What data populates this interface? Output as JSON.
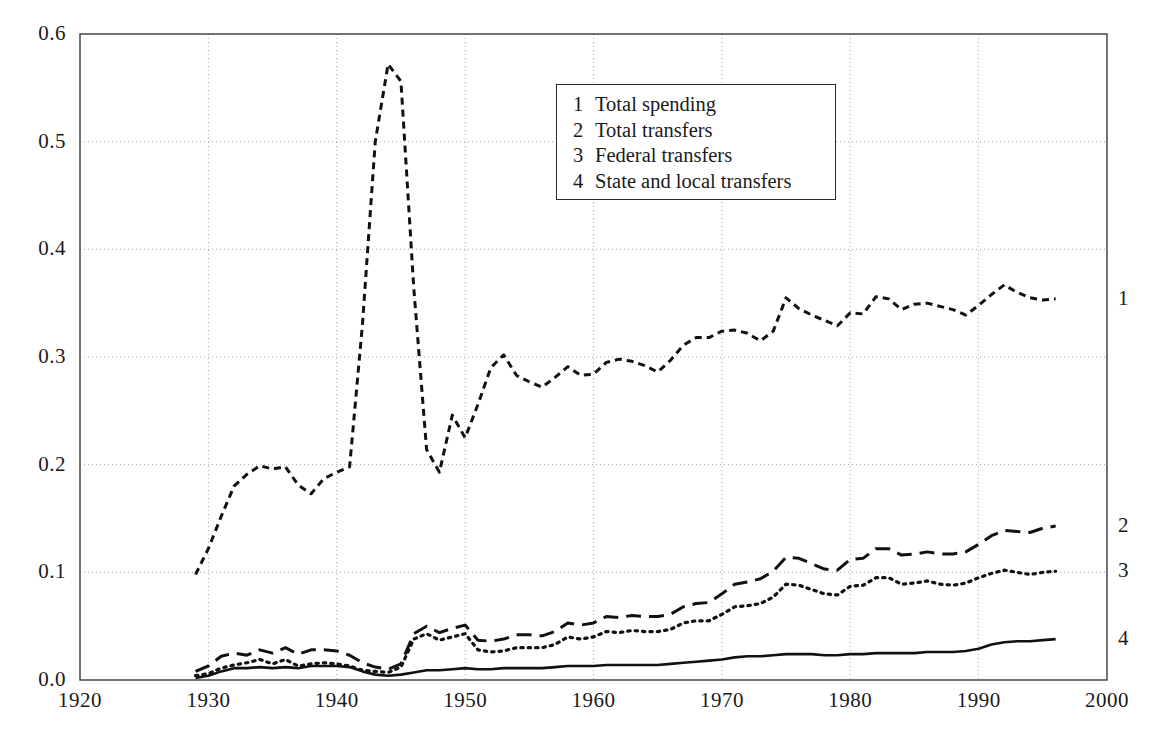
{
  "chart_data": {
    "type": "line",
    "title": "",
    "xlabel": "",
    "ylabel": "",
    "xlim": [
      1920,
      2000
    ],
    "ylim": [
      0.0,
      0.6
    ],
    "grid": true,
    "xticks": [
      "1920",
      "1930",
      "1940",
      "1950",
      "1960",
      "1970",
      "1980",
      "1990",
      "2000"
    ],
    "yticks": [
      "0.0",
      "0.1",
      "0.2",
      "0.3",
      "0.4",
      "0.5",
      "0.6"
    ],
    "legend_position": "upper-center",
    "legend": [
      {
        "key": "1",
        "label": "Total spending"
      },
      {
        "key": "2",
        "label": "Total transfers"
      },
      {
        "key": "3",
        "label": "Federal transfers"
      },
      {
        "key": "4",
        "label": "State and local transfers"
      }
    ],
    "x": [
      1929,
      1930,
      1931,
      1932,
      1933,
      1934,
      1935,
      1936,
      1937,
      1938,
      1939,
      1940,
      1941,
      1942,
      1943,
      1944,
      1945,
      1946,
      1947,
      1948,
      1949,
      1950,
      1951,
      1952,
      1953,
      1954,
      1955,
      1956,
      1957,
      1958,
      1959,
      1960,
      1961,
      1962,
      1963,
      1964,
      1965,
      1966,
      1967,
      1968,
      1969,
      1970,
      1971,
      1972,
      1973,
      1974,
      1975,
      1976,
      1977,
      1978,
      1979,
      1980,
      1981,
      1982,
      1983,
      1984,
      1985,
      1986,
      1987,
      1988,
      1989,
      1990,
      1991,
      1992,
      1993,
      1994,
      1995,
      1996
    ],
    "series": [
      {
        "name": "Total spending",
        "key": "1",
        "style": "short-dash",
        "end_label": "1",
        "values": [
          0.098,
          0.122,
          0.152,
          0.18,
          0.191,
          0.199,
          0.196,
          0.198,
          0.181,
          0.173,
          0.187,
          0.193,
          0.198,
          0.33,
          0.5,
          0.572,
          0.556,
          0.364,
          0.214,
          0.193,
          0.246,
          0.225,
          0.256,
          0.29,
          0.302,
          0.283,
          0.277,
          0.272,
          0.281,
          0.291,
          0.283,
          0.284,
          0.295,
          0.298,
          0.296,
          0.292,
          0.286,
          0.297,
          0.311,
          0.318,
          0.318,
          0.324,
          0.325,
          0.322,
          0.315,
          0.324,
          0.355,
          0.345,
          0.339,
          0.334,
          0.329,
          0.341,
          0.34,
          0.356,
          0.354,
          0.344,
          0.349,
          0.35,
          0.347,
          0.344,
          0.339,
          0.348,
          0.358,
          0.367,
          0.36,
          0.355,
          0.353,
          0.354
        ]
      },
      {
        "name": "Total transfers",
        "key": "2",
        "style": "long-dash",
        "end_label": "2",
        "values": [
          0.008,
          0.013,
          0.022,
          0.025,
          0.023,
          0.028,
          0.025,
          0.03,
          0.024,
          0.028,
          0.028,
          0.027,
          0.023,
          0.016,
          0.012,
          0.01,
          0.015,
          0.043,
          0.05,
          0.044,
          0.048,
          0.051,
          0.037,
          0.036,
          0.038,
          0.042,
          0.042,
          0.041,
          0.045,
          0.053,
          0.051,
          0.053,
          0.059,
          0.058,
          0.06,
          0.059,
          0.059,
          0.061,
          0.068,
          0.071,
          0.072,
          0.08,
          0.089,
          0.091,
          0.094,
          0.101,
          0.114,
          0.113,
          0.108,
          0.103,
          0.102,
          0.112,
          0.113,
          0.122,
          0.122,
          0.116,
          0.117,
          0.119,
          0.117,
          0.117,
          0.119,
          0.126,
          0.134,
          0.139,
          0.138,
          0.137,
          0.141,
          0.143
        ]
      },
      {
        "name": "Federal transfers",
        "key": "3",
        "style": "dotted",
        "end_label": "3",
        "values": [
          0.004,
          0.006,
          0.011,
          0.014,
          0.016,
          0.019,
          0.015,
          0.019,
          0.013,
          0.015,
          0.016,
          0.015,
          0.013,
          0.009,
          0.008,
          0.007,
          0.012,
          0.038,
          0.043,
          0.037,
          0.04,
          0.043,
          0.028,
          0.026,
          0.027,
          0.03,
          0.03,
          0.03,
          0.033,
          0.04,
          0.038,
          0.04,
          0.045,
          0.044,
          0.046,
          0.045,
          0.045,
          0.047,
          0.053,
          0.055,
          0.055,
          0.061,
          0.068,
          0.069,
          0.071,
          0.077,
          0.089,
          0.088,
          0.084,
          0.08,
          0.079,
          0.087,
          0.088,
          0.095,
          0.095,
          0.089,
          0.09,
          0.092,
          0.089,
          0.088,
          0.09,
          0.095,
          0.099,
          0.102,
          0.1,
          0.098,
          0.1,
          0.101
        ]
      },
      {
        "name": "State and local transfers",
        "key": "4",
        "style": "solid",
        "end_label": "4",
        "values": [
          0.002,
          0.004,
          0.008,
          0.011,
          0.011,
          0.012,
          0.011,
          0.012,
          0.011,
          0.013,
          0.013,
          0.013,
          0.012,
          0.008,
          0.005,
          0.004,
          0.005,
          0.007,
          0.009,
          0.009,
          0.01,
          0.011,
          0.01,
          0.01,
          0.011,
          0.011,
          0.011,
          0.011,
          0.012,
          0.013,
          0.013,
          0.013,
          0.014,
          0.014,
          0.014,
          0.014,
          0.014,
          0.015,
          0.016,
          0.017,
          0.018,
          0.019,
          0.021,
          0.022,
          0.022,
          0.023,
          0.024,
          0.024,
          0.024,
          0.023,
          0.023,
          0.024,
          0.024,
          0.025,
          0.025,
          0.025,
          0.025,
          0.026,
          0.026,
          0.026,
          0.027,
          0.029,
          0.033,
          0.035,
          0.036,
          0.036,
          0.037,
          0.038
        ]
      }
    ]
  }
}
